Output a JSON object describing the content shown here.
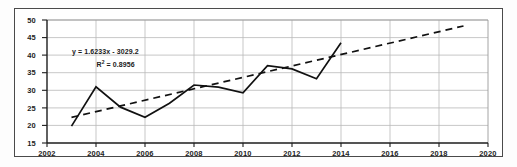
{
  "chart_data": {
    "type": "line",
    "title": "",
    "subtitle": "",
    "xlabel": "",
    "ylabel": "",
    "xlim": [
      2002,
      2020
    ],
    "ylim": [
      15,
      50
    ],
    "grid": true,
    "legend": "none",
    "x_ticks": [
      "2002",
      "2004",
      "2006",
      "2008",
      "2010",
      "2012",
      "2014",
      "2016",
      "2018",
      "2020"
    ],
    "y_ticks": [
      "15",
      "20",
      "25",
      "30",
      "35",
      "40",
      "45",
      "50"
    ],
    "x": [
      2003,
      2004,
      2005,
      2006,
      2007,
      2008,
      2009,
      2010,
      2011,
      2012,
      2013,
      2014
    ],
    "series": [
      {
        "name": "data-series",
        "style": "solid",
        "color": "#111111",
        "values": [
          19.8,
          31.0,
          25.2,
          22.3,
          26.3,
          31.5,
          30.9,
          29.3,
          37.0,
          36.1,
          33.3,
          43.5
        ]
      },
      {
        "name": "linear-trendline",
        "style": "dashed",
        "color": "#111111",
        "x": [
          2003,
          2019
        ],
        "values": [
          22.3,
          48.3
        ]
      }
    ],
    "annotations": [
      {
        "name": "trendline-equation",
        "text": "y = 1.6233x - 3029.2"
      },
      {
        "name": "trendline-r-squared",
        "text_prefix": "R",
        "text_sup": "2",
        "text_suffix": " = 0.8956"
      }
    ]
  },
  "colors": {
    "frame": "#4a4a4a",
    "axis": "#222222",
    "gridline": "#b9b9b9",
    "data_line": "#111111",
    "trendline": "#111111",
    "background": "#ffffff",
    "text": "#1a1a1a"
  }
}
